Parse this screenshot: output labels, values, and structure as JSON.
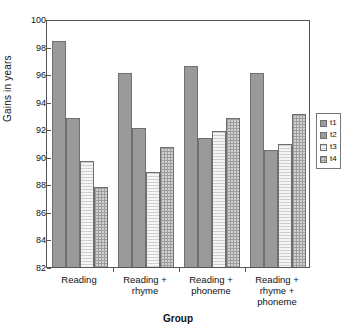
{
  "chart_data": {
    "type": "bar",
    "title": "",
    "xlabel": "Group",
    "ylabel": "Gains in years",
    "ylim": [
      82,
      100
    ],
    "yticks": [
      82,
      84,
      86,
      88,
      90,
      92,
      94,
      96,
      98,
      100
    ],
    "grid": false,
    "legend_position": "right",
    "categories": [
      "Reading",
      "Reading + rhyme",
      "Reading + phoneme",
      "Reading + rhyme + phoneme"
    ],
    "category_lines": [
      [
        "Reading"
      ],
      [
        "Reading +",
        "rhyme"
      ],
      [
        "Reading +",
        "phoneme"
      ],
      [
        "Reading +",
        "rhyme +",
        "phoneme"
      ]
    ],
    "series": [
      {
        "name": "t1",
        "values": [
          98.4,
          96.1,
          96.6,
          96.1
        ],
        "fill": "solid-gray",
        "color": "#9a9a9a"
      },
      {
        "name": "t2",
        "values": [
          92.8,
          92.1,
          91.4,
          90.5
        ],
        "fill": "solid-gray",
        "color": "#9a9a9a"
      },
      {
        "name": "t3",
        "values": [
          89.7,
          88.9,
          91.9,
          90.9
        ],
        "fill": "light-lines",
        "color": "#efefef"
      },
      {
        "name": "t4",
        "values": [
          87.8,
          90.7,
          92.8,
          93.1
        ],
        "fill": "crosshatch",
        "color": "#d2d2d2"
      }
    ]
  },
  "legend": {
    "items": [
      {
        "label": "t1"
      },
      {
        "label": "t2"
      },
      {
        "label": "t3"
      },
      {
        "label": "t4"
      }
    ]
  },
  "axes": {
    "y_title": "Gains in years",
    "x_title": "Group",
    "y_tick_labels": [
      "82",
      "84",
      "86",
      "88",
      "90",
      "92",
      "94",
      "96",
      "98",
      "100"
    ]
  }
}
